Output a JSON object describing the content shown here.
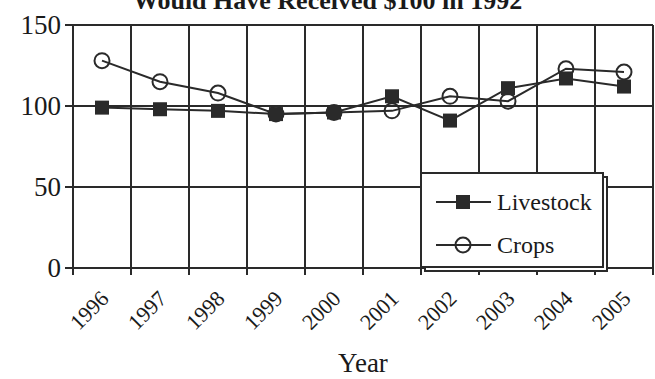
{
  "chart_data": {
    "type": "line",
    "title": "Would Have Received $100 in 1992",
    "xlabel": "Year",
    "ylabel": "",
    "categories": [
      "1996",
      "1997",
      "1998",
      "1999",
      "2000",
      "2001",
      "2002",
      "2003",
      "2004",
      "2005"
    ],
    "series": [
      {
        "name": "Livestock",
        "marker": "filled-square",
        "values": [
          99,
          98,
          97,
          95,
          96,
          106,
          91,
          111,
          117,
          112
        ]
      },
      {
        "name": "Crops",
        "marker": "open-circle",
        "values": [
          128,
          115,
          108,
          95,
          96,
          97,
          106,
          103,
          123,
          121
        ]
      }
    ],
    "ylim": [
      0,
      150
    ],
    "yticks": [
      0,
      50,
      100,
      150
    ],
    "grid": true,
    "legend_position": "lower right, inside plot",
    "colors": {
      "line": "#2a2a2a",
      "marker_fill": "#2a2a2a",
      "background": "#ffffff"
    }
  }
}
